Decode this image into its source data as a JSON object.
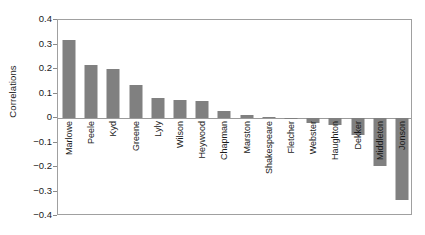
{
  "chart_data": {
    "type": "bar",
    "title": "",
    "xlabel": "",
    "ylabel": "Correlations",
    "ylim": [
      -0.4,
      0.4
    ],
    "ytick_labels": [
      "0.4",
      "0.3",
      "0.2",
      "0.1",
      "0",
      "−0.1",
      "−0.2",
      "−0.3",
      "−0.4"
    ],
    "ytick_values": [
      0.4,
      0.3,
      0.2,
      0.1,
      0,
      -0.1,
      -0.2,
      -0.3,
      -0.4
    ],
    "grid": false,
    "legend": "none",
    "orientation": "vertical",
    "bar_color": "#808080",
    "axis_color": "#a0a0a0",
    "zero_line": 0,
    "categories": [
      "Marlowe",
      "Peele",
      "Kyd",
      "Greene",
      "Lyly",
      "Wilson",
      "Heywood",
      "Chapman",
      "Marston",
      "Shakespeare",
      "Fletcher",
      "Webster",
      "Haughton",
      "Dekker",
      "Middleton",
      "Jonson"
    ],
    "values": [
      0.317,
      0.217,
      0.2,
      0.133,
      0.083,
      0.075,
      0.071,
      0.028,
      0.012,
      0.003,
      -0.005,
      -0.022,
      -0.03,
      -0.07,
      -0.196,
      -0.333
    ]
  }
}
